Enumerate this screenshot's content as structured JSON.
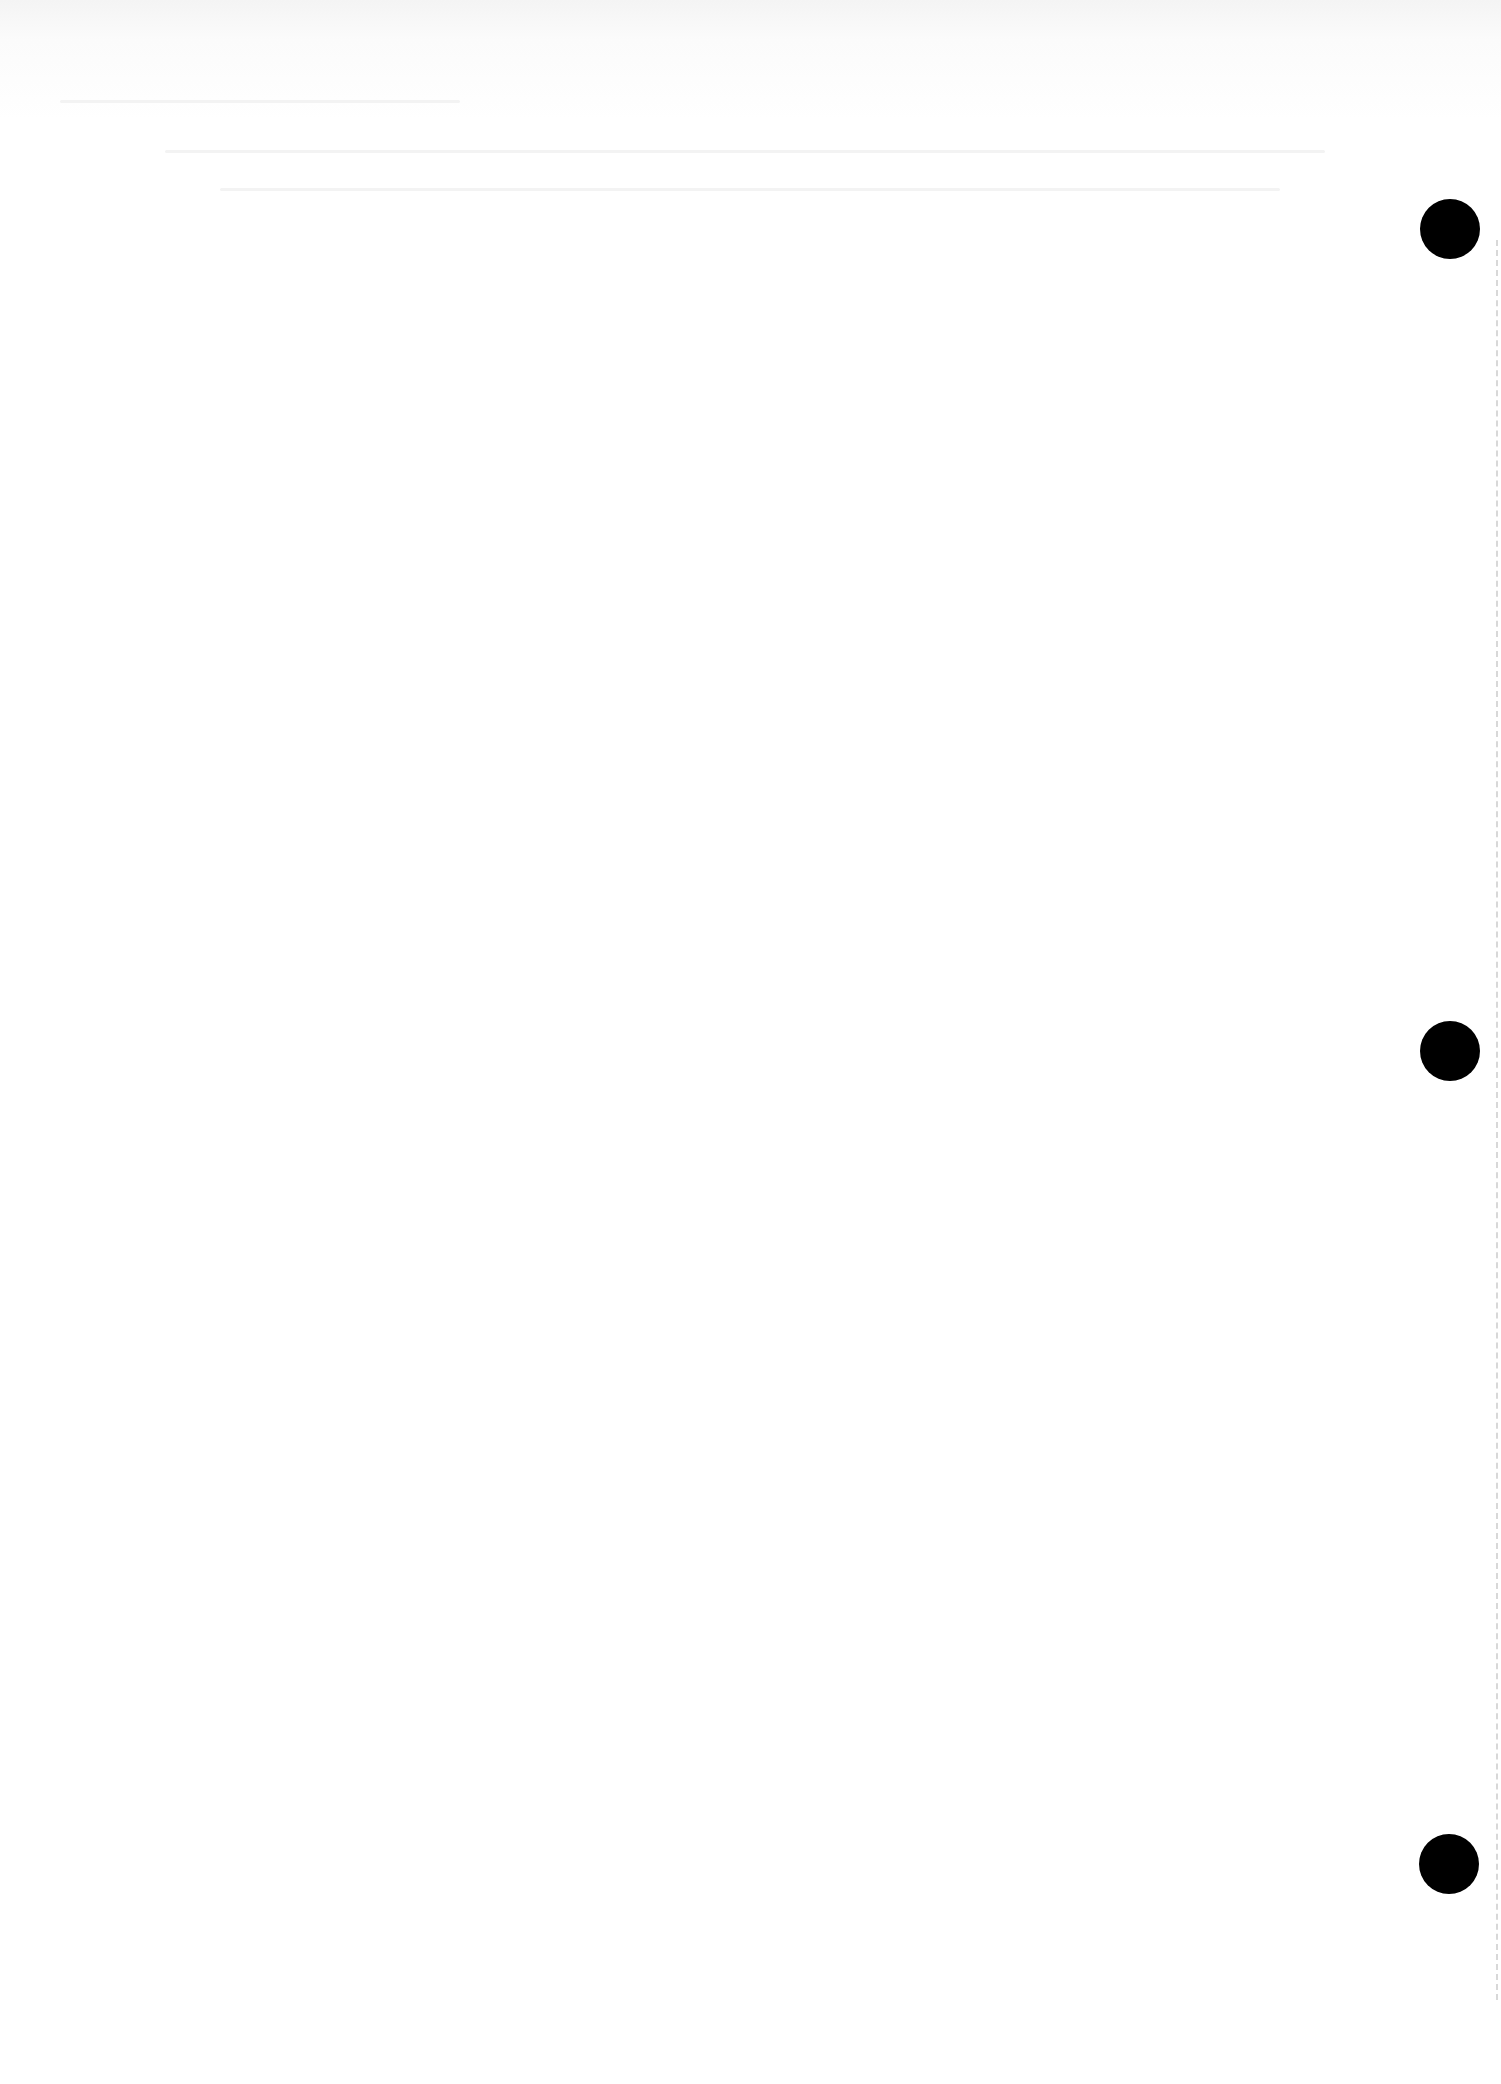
{
  "page": {
    "type": "blank scanned sheet",
    "background_color": "#ffffff",
    "text": ""
  },
  "punch_holes": [
    {
      "cx": 1450,
      "cy": 229,
      "r": 30,
      "color": "#000000"
    },
    {
      "cx": 1450,
      "cy": 1051,
      "r": 30,
      "color": "#000000"
    },
    {
      "cx": 1449,
      "cy": 1864,
      "r": 30,
      "color": "#000000"
    }
  ]
}
